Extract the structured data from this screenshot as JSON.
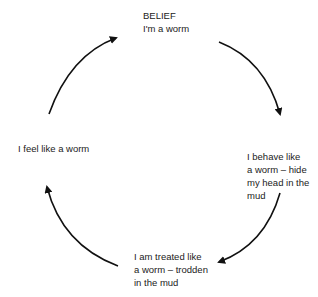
{
  "diagram": {
    "type": "cycle",
    "nodes": [
      {
        "id": "belief",
        "lines": [
          "BELIEF",
          "I'm a worm"
        ]
      },
      {
        "id": "behave",
        "lines": [
          "I behave like",
          "a worm – hide",
          "my head in the",
          "mud"
        ]
      },
      {
        "id": "treated",
        "lines": [
          "I am treated like",
          "a worm – trodden",
          "in the mud"
        ]
      },
      {
        "id": "feel",
        "lines": [
          "I feel like a worm"
        ]
      }
    ],
    "edges": [
      {
        "from": "belief",
        "to": "behave"
      },
      {
        "from": "behave",
        "to": "treated"
      },
      {
        "from": "treated",
        "to": "feel"
      },
      {
        "from": "feel",
        "to": "belief"
      }
    ],
    "colors": {
      "arrow": "#111111",
      "text": "#222222",
      "background": "#ffffff"
    }
  }
}
